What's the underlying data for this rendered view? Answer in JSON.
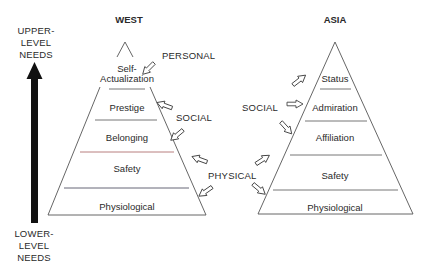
{
  "axis": {
    "top_label": [
      "UPPER-",
      "LEVEL",
      "NEEDS"
    ],
    "bottom_label": [
      "LOWER-",
      "LEVEL",
      "NEEDS"
    ],
    "arrow": "up-arrow"
  },
  "west": {
    "title": "WEST",
    "tiers": [
      {
        "label": [
          "Self-",
          "Actualization"
        ]
      },
      {
        "label": [
          "Prestige"
        ]
      },
      {
        "label": [
          "Belonging"
        ]
      },
      {
        "label": [
          "Safety"
        ]
      },
      {
        "label": [
          "Physiological"
        ]
      }
    ]
  },
  "asia": {
    "title": "ASIA",
    "tiers": [
      {
        "label": [
          "Status"
        ]
      },
      {
        "label": [
          "Admiration"
        ]
      },
      {
        "label": [
          "Affiliation"
        ]
      },
      {
        "label": [
          "Safety"
        ]
      },
      {
        "label": [
          "Physiological"
        ]
      }
    ]
  },
  "categories": {
    "personal": "PERSONAL",
    "social_west": "SOCIAL",
    "social_asia": "SOCIAL",
    "physical": "PHYSICAL"
  },
  "colors": {
    "ink": "#2a2a2a",
    "line": "#555555",
    "accent_line": "#b07070",
    "background": "#ffffff"
  }
}
